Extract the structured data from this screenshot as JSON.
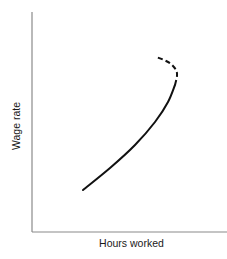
{
  "chart_data": {
    "type": "line",
    "title": "",
    "xlabel": "Hours worked",
    "ylabel": "Wage rate",
    "grid": false,
    "legend": null,
    "axis_ticks": "none",
    "series": [
      {
        "name": "Labor supply curve (upward-sloping segment)",
        "style": "solid",
        "points_px": [
          [
            83,
            190
          ],
          [
            110,
            168
          ],
          [
            135,
            145
          ],
          [
            155,
            122
          ],
          [
            168,
            102
          ],
          [
            175,
            85
          ]
        ]
      },
      {
        "name": "Labor supply curve (backward-bending segment)",
        "style": "dashed",
        "points_px": [
          [
            175,
            85
          ],
          [
            177,
            76
          ],
          [
            176,
            70
          ],
          [
            171,
            64
          ],
          [
            164,
            60
          ],
          [
            156,
            57
          ]
        ]
      }
    ]
  },
  "colors": {
    "curve": "#111111",
    "axis": "#8a8a8a",
    "background": "#ffffff"
  }
}
